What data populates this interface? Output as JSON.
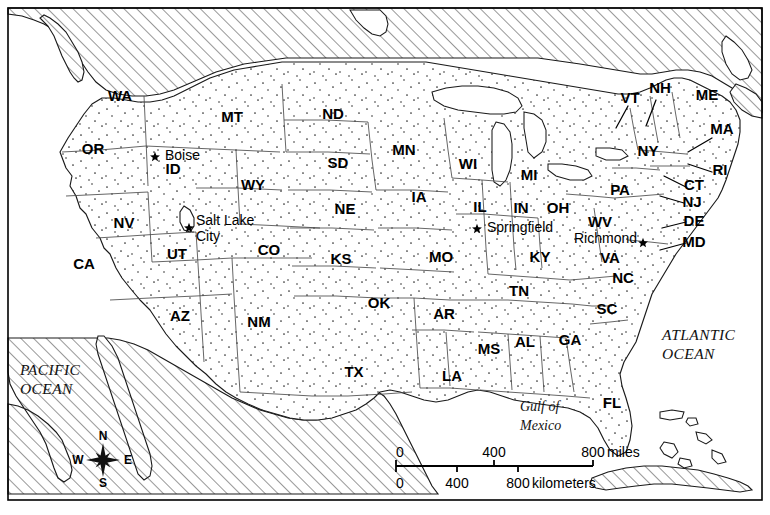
{
  "map": {
    "title": "United States Political Map",
    "frame": {
      "x": 8,
      "y": 8,
      "width": 754,
      "height": 492
    },
    "states": [
      {
        "code": "WA",
        "name": "Washington",
        "x": 120,
        "y": 97
      },
      {
        "code": "OR",
        "name": "Oregon",
        "x": 93,
        "y": 150
      },
      {
        "code": "CA",
        "name": "California",
        "x": 84,
        "y": 265
      },
      {
        "code": "NV",
        "name": "Nevada",
        "x": 124,
        "y": 224
      },
      {
        "code": "ID",
        "name": "Idaho",
        "x": 173,
        "y": 170
      },
      {
        "code": "MT",
        "name": "Montana",
        "x": 232,
        "y": 118
      },
      {
        "code": "WY",
        "name": "Wyoming",
        "x": 253,
        "y": 186
      },
      {
        "code": "UT",
        "name": "Utah",
        "x": 177,
        "y": 255
      },
      {
        "code": "AZ",
        "name": "Arizona",
        "x": 180,
        "y": 317
      },
      {
        "code": "NM",
        "name": "New Mexico",
        "x": 259,
        "y": 323
      },
      {
        "code": "CO",
        "name": "Colorado",
        "x": 269,
        "y": 251
      },
      {
        "code": "ND",
        "name": "North Dakota",
        "x": 333,
        "y": 115
      },
      {
        "code": "SD",
        "name": "South Dakota",
        "x": 338,
        "y": 164
      },
      {
        "code": "NE",
        "name": "Nebraska",
        "x": 345,
        "y": 210
      },
      {
        "code": "KS",
        "name": "Kansas",
        "x": 341,
        "y": 260
      },
      {
        "code": "OK",
        "name": "Oklahoma",
        "x": 379,
        "y": 304
      },
      {
        "code": "TX",
        "name": "Texas",
        "x": 354,
        "y": 373
      },
      {
        "code": "MN",
        "name": "Minnesota",
        "x": 404,
        "y": 151
      },
      {
        "code": "IA",
        "name": "Iowa",
        "x": 419,
        "y": 198
      },
      {
        "code": "MO",
        "name": "Missouri",
        "x": 441,
        "y": 258
      },
      {
        "code": "AR",
        "name": "Arkansas",
        "x": 444,
        "y": 315
      },
      {
        "code": "LA",
        "name": "Louisiana",
        "x": 452,
        "y": 377
      },
      {
        "code": "MS",
        "name": "Mississippi",
        "x": 489,
        "y": 350
      },
      {
        "code": "AL",
        "name": "Alabama",
        "x": 525,
        "y": 343
      },
      {
        "code": "GA",
        "name": "Georgia",
        "x": 570,
        "y": 341
      },
      {
        "code": "FL",
        "name": "Florida",
        "x": 612,
        "y": 404
      },
      {
        "code": "TN",
        "name": "Tennessee",
        "x": 519,
        "y": 292
      },
      {
        "code": "KY",
        "name": "Kentucky",
        "x": 540,
        "y": 258
      },
      {
        "code": "SC",
        "name": "South Carolina",
        "x": 607,
        "y": 310
      },
      {
        "code": "NC",
        "name": "North Carolina",
        "x": 623,
        "y": 279
      },
      {
        "code": "VA",
        "name": "Virginia",
        "x": 610,
        "y": 259
      },
      {
        "code": "WV",
        "name": "West Virginia",
        "x": 600,
        "y": 223
      },
      {
        "code": "OH",
        "name": "Ohio",
        "x": 558,
        "y": 209
      },
      {
        "code": "IN",
        "name": "Indiana",
        "x": 521,
        "y": 209
      },
      {
        "code": "IL",
        "name": "Illinois",
        "x": 480,
        "y": 208
      },
      {
        "code": "MI",
        "name": "Michigan",
        "x": 529,
        "y": 176
      },
      {
        "code": "WI",
        "name": "Wisconsin",
        "x": 468,
        "y": 165
      },
      {
        "code": "PA",
        "name": "Pennsylvania",
        "x": 620,
        "y": 191
      },
      {
        "code": "NY",
        "name": "New York",
        "x": 648,
        "y": 152
      },
      {
        "code": "ME",
        "name": "Maine",
        "x": 707,
        "y": 96
      },
      {
        "code": "NH",
        "name": "New Hampshire",
        "x": 660,
        "y": 89
      },
      {
        "code": "VT",
        "name": "Vermont",
        "x": 630,
        "y": 99
      },
      {
        "code": "MA",
        "name": "Massachusetts",
        "x": 722,
        "y": 130
      },
      {
        "code": "RI",
        "name": "Rhode Island",
        "x": 720,
        "y": 171
      },
      {
        "code": "CT",
        "name": "Connecticut",
        "x": 694,
        "y": 186
      },
      {
        "code": "NJ",
        "name": "New Jersey",
        "x": 692,
        "y": 203
      },
      {
        "code": "DE",
        "name": "Delaware",
        "x": 694,
        "y": 222
      },
      {
        "code": "MD",
        "name": "Maryland",
        "x": 694,
        "y": 243
      }
    ],
    "cities": [
      {
        "name": "Boise",
        "label_x": 165,
        "label_y": 156,
        "star_x": 155,
        "star_y": 157,
        "anchor": "start",
        "lines": [
          "Boise"
        ]
      },
      {
        "name": "Salt Lake City",
        "label_x": 196,
        "label_y": 221,
        "star_x": 189,
        "star_y": 228,
        "anchor": "start",
        "lines": [
          "Salt Lake",
          "City"
        ]
      },
      {
        "name": "Springfield",
        "label_x": 487,
        "label_y": 228,
        "star_x": 477,
        "star_y": 229,
        "anchor": "start",
        "lines": [
          "Springfield"
        ]
      },
      {
        "name": "Richmond",
        "label_x": 637,
        "label_y": 239,
        "star_x": 643,
        "star_y": 243,
        "anchor": "end",
        "lines": [
          "Richmond"
        ]
      }
    ],
    "water_labels": [
      {
        "name": "pacific-ocean",
        "x": 20,
        "y": 371,
        "lines": [
          "PACIFIC",
          "OCEAN"
        ],
        "style": "ocean"
      },
      {
        "name": "atlantic-ocean",
        "x": 662,
        "y": 336,
        "lines": [
          "ATLANTIC",
          "OCEAN"
        ],
        "style": "ocean"
      },
      {
        "name": "gulf-of-mexico",
        "x": 520,
        "y": 408,
        "lines": [
          "Gulf of",
          "Mexico"
        ],
        "style": "gulf"
      }
    ],
    "scale_bar": {
      "x0": 396,
      "x1": 593,
      "y_bar": 466,
      "miles": {
        "unit_label": "miles",
        "ticks": [
          {
            "value": "0",
            "x": 396
          },
          {
            "value": "400",
            "x": 494
          },
          {
            "value": "800",
            "x": 593
          }
        ],
        "label_y": 453
      },
      "kilometers": {
        "unit_label": "kilometers",
        "ticks": [
          {
            "value": "0",
            "x": 396
          },
          {
            "value": "400",
            "x": 457
          },
          {
            "value": "800",
            "x": 518
          }
        ],
        "label_y": 484
      }
    },
    "compass": {
      "cx": 103,
      "cy": 460,
      "r": 17,
      "points": [
        {
          "dir": "N",
          "x": 103,
          "y": 437
        },
        {
          "dir": "E",
          "x": 128,
          "y": 461
        },
        {
          "dir": "S",
          "x": 103,
          "y": 484
        },
        {
          "dir": "W",
          "x": 78,
          "y": 461
        }
      ]
    },
    "colors": {
      "land_fill": "#ffffff",
      "stipple": "#2b2b2b",
      "foreign_hatch": "#3a3a3a",
      "national_border": "#1a1a1a",
      "state_border": "#4a4a4a",
      "water": "#ffffff",
      "text": "#000000"
    }
  }
}
